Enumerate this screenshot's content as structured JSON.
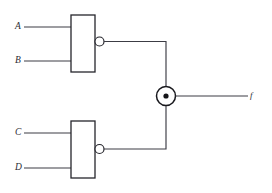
{
  "diagram": {
    "type": "logic-circuit-schematic",
    "background_color": "#ffffff",
    "line_color": "#3c3c44",
    "gate_outline_color": "#25252c"
  },
  "inputs": [
    {
      "id": "A",
      "label": "A",
      "gate": "nand-1",
      "pin": 1,
      "label_x": 15,
      "label_y": 22,
      "wire_y": 27,
      "wire_x_start": 24,
      "wire_x_end": 71
    },
    {
      "id": "B",
      "label": "B",
      "gate": "nand-1",
      "pin": 2,
      "label_x": 15,
      "label_y": 56,
      "wire_y": 61,
      "wire_x_start": 24,
      "wire_x_end": 71
    },
    {
      "id": "C",
      "label": "C",
      "gate": "nand-2",
      "pin": 1,
      "label_x": 15,
      "label_y": 128,
      "wire_y": 133,
      "wire_x_start": 24,
      "wire_x_end": 71
    },
    {
      "id": "D",
      "label": "D",
      "gate": "nand-2",
      "pin": 2,
      "label_x": 15,
      "label_y": 163,
      "wire_y": 168,
      "wire_x_start": 24,
      "wire_x_end": 71
    }
  ],
  "gates": [
    {
      "id": "nand-1",
      "kind": "nand",
      "shape": "rectangle-with-bubble",
      "box": {
        "x": 71,
        "y": 15,
        "width": 24,
        "height": 57
      },
      "bubble": {
        "cx": 99.5,
        "cy": 41.5,
        "r": 4.5
      },
      "output_y": 41.5
    },
    {
      "id": "nand-2",
      "kind": "nand",
      "shape": "rectangle-with-bubble",
      "box": {
        "x": 71,
        "y": 121,
        "width": 24,
        "height": 57
      },
      "bubble": {
        "cx": 99.5,
        "cy": 149,
        "r": 4.5
      },
      "output_y": 149
    },
    {
      "id": "xor-1",
      "kind": "xor",
      "shape": "circle-with-dot",
      "circle": {
        "cx": 166,
        "cy": 96,
        "r": 9.5
      },
      "dot": {
        "cx": 166,
        "cy": 96,
        "r": 2.6
      }
    }
  ],
  "wires": [
    {
      "id": "nand1-to-xor",
      "from": "nand-1",
      "to": "xor-1",
      "path": "M 104 41.5 L 166 41.5 L 166 86.5"
    },
    {
      "id": "nand2-to-xor",
      "from": "nand-2",
      "to": "xor-1",
      "path": "M 104 149 L 166 149 L 166 105.5"
    },
    {
      "id": "xor-to-output",
      "from": "xor-1",
      "to": "f",
      "path": "M 175.5 96 L 248 96"
    }
  ],
  "output": {
    "id": "f",
    "label": "f",
    "label_x": 250,
    "label_y": 91,
    "wire_y": 96,
    "wire_x_start": 175.5,
    "wire_x_end": 248
  }
}
